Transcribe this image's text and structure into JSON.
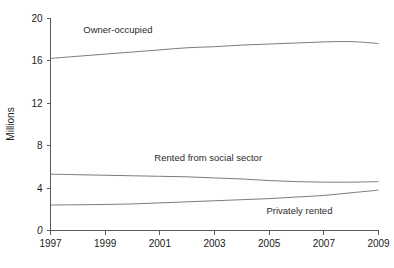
{
  "chart_data": {
    "type": "line",
    "title": "",
    "xlabel": "",
    "ylabel": "Millions",
    "xlim": [
      1997,
      2009
    ],
    "ylim": [
      0,
      20
    ],
    "grid": false,
    "legend_position": "inline-labels",
    "x_ticks": [
      "1997",
      "1999",
      "2001",
      "2003",
      "2005",
      "2007",
      "2009"
    ],
    "x_tick_values": [
      1997,
      1999,
      2001,
      2003,
      2005,
      2007,
      2009
    ],
    "y_ticks": [
      "0",
      "4",
      "8",
      "12",
      "16",
      "20"
    ],
    "y_tick_values": [
      0,
      4,
      8,
      12,
      16,
      20
    ],
    "x": [
      1997,
      1998,
      1999,
      2000,
      2001,
      2002,
      2003,
      2004,
      2005,
      2006,
      2007,
      2008,
      2009
    ],
    "series": [
      {
        "name": "Owner-occupied",
        "label": "Owner-occupied",
        "values": [
          16.2,
          16.4,
          16.6,
          16.8,
          17.0,
          17.2,
          17.3,
          17.45,
          17.55,
          17.65,
          17.75,
          17.78,
          17.6
        ]
      },
      {
        "name": "Rented from social sector",
        "label": "Rented from social sector",
        "values": [
          5.3,
          5.25,
          5.2,
          5.15,
          5.1,
          5.05,
          4.95,
          4.85,
          4.7,
          4.6,
          4.55,
          4.55,
          4.6
        ]
      },
      {
        "name": "Privately rented",
        "label": "Privately rented",
        "values": [
          2.4,
          2.42,
          2.45,
          2.5,
          2.6,
          2.7,
          2.8,
          2.9,
          3.0,
          3.15,
          3.3,
          3.55,
          3.8
        ]
      }
    ],
    "annotations": [
      {
        "text": "Owner-occupied",
        "x": 1998.2,
        "y": 18.6
      },
      {
        "text": "Rented from social sector",
        "x": 2000.8,
        "y": 6.5
      },
      {
        "text": "Privately rented",
        "x": 2004.9,
        "y": 1.6
      }
    ]
  },
  "caption": {
    "text": ""
  },
  "colors": {
    "line": "#7c7c7c",
    "axis": "#5a5a5a",
    "text": "#1a1a1a",
    "background": "#ffffff"
  }
}
